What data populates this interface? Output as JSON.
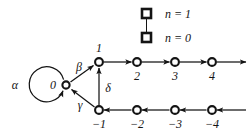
{
  "figure": {
    "type": "state-transition-diagram",
    "background_color": "#ffffff",
    "ink_color": "#141414"
  },
  "legend": {
    "marker_icon": "square-marker",
    "connector_icon": "vertical-connector-line",
    "entries": [
      {
        "label": "n = 1",
        "marker": "open-square"
      },
      {
        "label": "n = 0",
        "marker": "open-square"
      }
    ]
  },
  "nodes": {
    "center": {
      "label": "0",
      "x": 66,
      "y": 85
    },
    "upper_row": [
      {
        "label": "1",
        "x": 99,
        "y": 62
      },
      {
        "label": "2",
        "x": 137,
        "y": 62
      },
      {
        "label": "3",
        "x": 175,
        "y": 62
      },
      {
        "label": "4",
        "x": 212,
        "y": 62
      }
    ],
    "lower_row": [
      {
        "label": "−1",
        "x": 99,
        "y": 110
      },
      {
        "label": "−2",
        "x": 137,
        "y": 110
      },
      {
        "label": "−3",
        "x": 175,
        "y": 110
      },
      {
        "label": "−4",
        "x": 212,
        "y": 110
      }
    ]
  },
  "edge_labels": {
    "alpha": "α",
    "beta": "β",
    "gamma": "γ",
    "delta": "δ"
  },
  "edges": [
    {
      "name": "self-loop-zero",
      "from": "0",
      "to": "0",
      "label": "α"
    },
    {
      "name": "zero-to-one",
      "from": "0",
      "to": "1",
      "label": "β"
    },
    {
      "name": "minus-one-to-zero",
      "from": "-1",
      "to": "0",
      "label": "γ"
    },
    {
      "name": "minus-one-to-one",
      "from": "-1",
      "to": "1",
      "label": "δ"
    },
    {
      "name": "one-to-two",
      "from": "1",
      "to": "2",
      "label": ""
    },
    {
      "name": "two-to-three",
      "from": "2",
      "to": "3",
      "label": ""
    },
    {
      "name": "three-to-four",
      "from": "3",
      "to": "4",
      "label": ""
    },
    {
      "name": "four-to-right",
      "from": "4",
      "to": "",
      "label": ""
    },
    {
      "name": "minus-two-to-minus-one",
      "from": "-2",
      "to": "-1",
      "label": ""
    },
    {
      "name": "minus-three-to-minus-two",
      "from": "-3",
      "to": "-2",
      "label": ""
    },
    {
      "name": "minus-four-to-minus-three",
      "from": "-4",
      "to": "-3",
      "label": ""
    },
    {
      "name": "right-to-minus-four",
      "from": "",
      "to": "-4",
      "label": ""
    }
  ]
}
